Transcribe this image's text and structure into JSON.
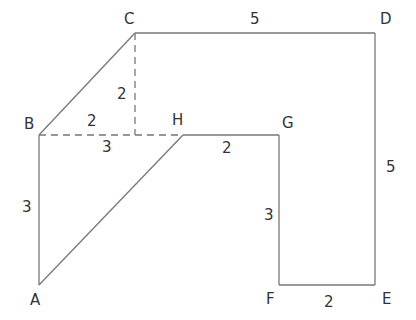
{
  "diagram": {
    "points": {
      "A": {
        "label": "A"
      },
      "B": {
        "label": "B"
      },
      "C": {
        "label": "C"
      },
      "D": {
        "label": "D"
      },
      "E": {
        "label": "E"
      },
      "F": {
        "label": "F"
      },
      "G": {
        "label": "G"
      },
      "H": {
        "label": "H"
      }
    },
    "lengths": {
      "CD": "5",
      "DE": "5",
      "EF": "2",
      "FG": "3",
      "GH": "2",
      "AB": "3",
      "BH": "3",
      "C_vertical_dashed": "2",
      "B_horizontal_dashed": "2"
    },
    "line_color": "#777777",
    "text_color": "#333333"
  }
}
